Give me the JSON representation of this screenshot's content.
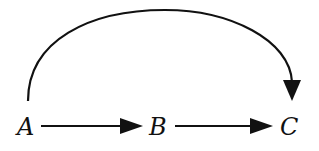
{
  "diagram": {
    "type": "directed-graph",
    "nodes": [
      {
        "id": "A",
        "label": "A"
      },
      {
        "id": "B",
        "label": "B"
      },
      {
        "id": "C",
        "label": "C"
      }
    ],
    "edges": [
      {
        "from": "A",
        "to": "B",
        "style": "straight"
      },
      {
        "from": "B",
        "to": "C",
        "style": "straight"
      },
      {
        "from": "A",
        "to": "C",
        "style": "curved-arc-above"
      }
    ],
    "colors": {
      "stroke": "#111111",
      "background": "#ffffff"
    }
  }
}
